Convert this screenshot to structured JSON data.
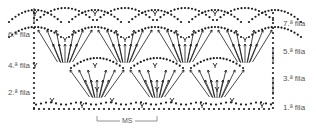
{
  "diagram": {
    "type": "crochet-chart",
    "colors": {
      "stitch": "#1a1a1a",
      "label": "#555555",
      "bracket": "#777777"
    },
    "row_labels_left": [
      {
        "text": "6.ª fila",
        "y": 31
      },
      {
        "text": "4.ª fila",
        "y": 62
      },
      {
        "text": "2.ª fila",
        "y": 89
      }
    ],
    "row_labels_right": [
      {
        "text": "7.ª fila",
        "y": 20
      },
      {
        "text": "5.ª fila",
        "y": 48
      },
      {
        "text": "3.ª fila",
        "y": 75
      },
      {
        "text": "1.ª fila",
        "y": 104
      }
    ],
    "repeat": {
      "label": "MS",
      "x_start": 97,
      "x_end": 157
    },
    "grid": {
      "x_start": 34,
      "x_end": 273,
      "repeat_width": 60,
      "y_bottom": 109,
      "y_top": 9
    }
  }
}
